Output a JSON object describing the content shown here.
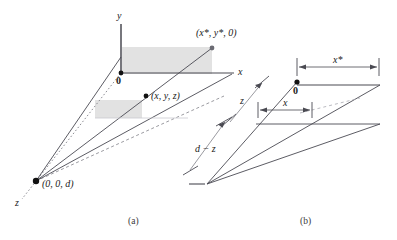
{
  "figure": {
    "background_color": "#ffffff",
    "line_color": "#4a4a52",
    "shade_color": "#e2e2e2",
    "text_color": "#1a1a1a",
    "width": 397,
    "height": 240
  },
  "captions": [
    {
      "key": "a",
      "text": "(a)",
      "x": 128,
      "y": 216
    },
    {
      "key": "b",
      "text": "(b)",
      "x": 300,
      "y": 216
    }
  ],
  "panel_a": {
    "axis_labels": [
      {
        "name": "y-axis-label",
        "text": "y",
        "x": 117,
        "y": 14,
        "style": "italic"
      },
      {
        "name": "x-axis-label",
        "text": "x",
        "x": 238,
        "y": 70,
        "style": "italic"
      },
      {
        "name": "z-axis-label",
        "text": "z",
        "x": 17,
        "y": 202,
        "style": "italic"
      }
    ],
    "point_labels": [
      {
        "name": "origin-label",
        "text": "0",
        "x": 117,
        "y": 76,
        "style": "bold"
      },
      {
        "name": "object-point-label",
        "text": "(x, y, z)",
        "x": 148,
        "y": 92,
        "style": "italic"
      },
      {
        "name": "image-point-label",
        "text": "(x*, y*, 0)",
        "x": 196,
        "y": 30,
        "style": "italic"
      },
      {
        "name": "center-of-projection-label",
        "text": "(0, 0, d)",
        "x": 40,
        "y": 180,
        "style": "italic"
      }
    ],
    "points": [
      {
        "name": "origin-dot",
        "x": 121,
        "y": 73
      },
      {
        "name": "object-point-dot",
        "x": 146,
        "y": 96
      },
      {
        "name": "image-point-dot",
        "x": 212,
        "y": 48
      },
      {
        "name": "center-of-projection-dot",
        "x": 36,
        "y": 181
      }
    ]
  },
  "panel_b": {
    "dimension_labels": [
      {
        "name": "x-star-dimension-label",
        "text": "x*",
        "x": 334,
        "y": 58,
        "style": "italic"
      },
      {
        "name": "x-dimension-label",
        "text": "x",
        "x": 286,
        "y": 100,
        "style": "italic"
      },
      {
        "name": "z-dimension-label",
        "text": "z",
        "x": 240,
        "y": 98,
        "style": "italic"
      },
      {
        "name": "d-minus-z-dimension-label",
        "text": "d − z",
        "x": 196,
        "y": 146,
        "style": "italic"
      }
    ],
    "point_labels": [
      {
        "name": "origin-b-label",
        "text": "0",
        "x": 294,
        "y": 87,
        "style": "bold"
      }
    ],
    "points": [
      {
        "name": "origin-b-dot",
        "x": 297,
        "y": 82
      }
    ]
  }
}
